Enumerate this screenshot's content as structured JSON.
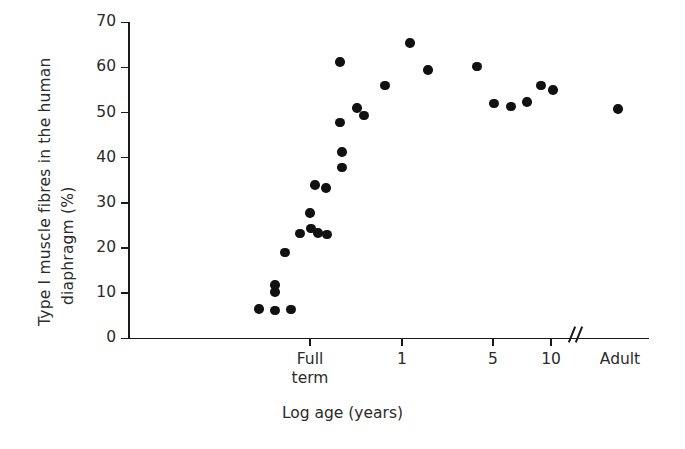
{
  "chart_data": {
    "type": "scatter",
    "title": "",
    "xlabel": "Log age (years)",
    "ylabel": "Type I muscle fibres in the human diaphragm (%)",
    "ylabel_lines": [
      "Type I muscle fibres in the human",
      "diaphragm (%)"
    ],
    "ylim": [
      0,
      70
    ],
    "yticks": [
      0,
      10,
      20,
      30,
      40,
      50,
      60,
      70
    ],
    "ytick_labels": [
      "0",
      "10",
      "20",
      "30",
      "40",
      "50",
      "60",
      "70"
    ],
    "xticks_labels": [
      "Full term",
      "1",
      "5",
      "10",
      "Adult"
    ],
    "xtick_detail": [
      {
        "label": "Full",
        "label2": "term",
        "px": 310
      },
      {
        "label": "1",
        "label2": "",
        "px": 402
      },
      {
        "label": "5",
        "label2": "",
        "px": 493
      },
      {
        "label": "10",
        "label2": "",
        "px": 551
      },
      {
        "label": "Adult",
        "label2": "",
        "px": 620
      }
    ],
    "axis_break_px": 566,
    "grid": false,
    "legend": null,
    "marker_color": "#111111",
    "axis_color": "#1a1a1a",
    "points": [
      {
        "px": 259,
        "value": 6.5
      },
      {
        "px": 275,
        "value": 6.2
      },
      {
        "px": 291,
        "value": 6.4
      },
      {
        "px": 275,
        "value": 10.3
      },
      {
        "px": 275,
        "value": 11.8
      },
      {
        "px": 285,
        "value": 19.0
      },
      {
        "px": 300,
        "value": 23.2
      },
      {
        "px": 311,
        "value": 24.3
      },
      {
        "px": 318,
        "value": 23.3
      },
      {
        "px": 327,
        "value": 23.0
      },
      {
        "px": 310,
        "value": 27.8
      },
      {
        "px": 315,
        "value": 34.0
      },
      {
        "px": 326,
        "value": 33.3
      },
      {
        "px": 342,
        "value": 37.8
      },
      {
        "px": 342,
        "value": 41.3
      },
      {
        "px": 340,
        "value": 47.8
      },
      {
        "px": 357,
        "value": 51.0
      },
      {
        "px": 364,
        "value": 49.3
      },
      {
        "px": 340,
        "value": 61.2
      },
      {
        "px": 385,
        "value": 56.0
      },
      {
        "px": 410,
        "value": 65.4
      },
      {
        "px": 428,
        "value": 59.4
      },
      {
        "px": 477,
        "value": 60.2
      },
      {
        "px": 494,
        "value": 52.0
      },
      {
        "px": 511,
        "value": 51.3
      },
      {
        "px": 527,
        "value": 52.4
      },
      {
        "px": 541,
        "value": 56.0
      },
      {
        "px": 553,
        "value": 55.0
      },
      {
        "px": 618,
        "value": 50.8
      }
    ]
  },
  "axis": {
    "y_label_line1": "Type I muscle fibres in the human",
    "y_label_line2": "diaphragm (%)",
    "x_label": "Log age (years)"
  }
}
